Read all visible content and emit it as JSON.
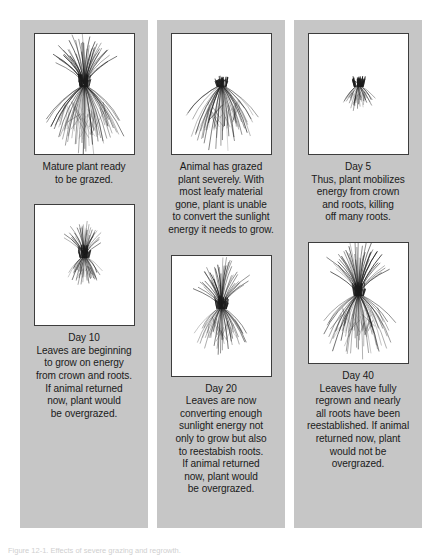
{
  "figure": {
    "background_color": "#ffffff",
    "panel_color": "#c6c6c6",
    "frame_border_color": "#3d3d3d",
    "text_color": "#1a1a1a",
    "note": "Figure 12-1. Effects of severe grazing and regrowth."
  },
  "panels": [
    {
      "id": "panel-1",
      "top": {
        "art_name": "mature-plant-illustration",
        "stage": "mature",
        "leaf_height": 46,
        "root_depth": 62,
        "leaf_density": 40,
        "root_density": 46,
        "caption": "Mature plant ready\nto be grazed."
      },
      "bottom": {
        "art_name": "day-10-plant-illustration",
        "stage": "day-10",
        "leaf_height": 30,
        "root_depth": 26,
        "leaf_density": 30,
        "root_density": 26,
        "caption": "Day 10\nLeaves are beginning\nto grow on energy\nfrom crown and roots.\nIf animal returned\nnow, plant would\nbe overgrazed."
      }
    },
    {
      "id": "panel-2",
      "top": {
        "art_name": "grazed-plant-illustration",
        "stage": "grazed",
        "leaf_height": 7,
        "root_depth": 58,
        "leaf_density": 16,
        "root_density": 44,
        "caption": "Animal has grazed\nplant severely. With\nmost leafy material\ngone, plant is unable\nto convert the sunlight\nenergy it needs to grow."
      },
      "bottom": {
        "art_name": "day-20-plant-illustration",
        "stage": "day-20",
        "leaf_height": 42,
        "root_depth": 42,
        "leaf_density": 38,
        "root_density": 36,
        "caption": "Day 20\nLeaves are now\nconverting enough\nsunlight energy not\nonly to grow but also\nto reestabish roots.\nIf animal returned\nnow, plant would\nbe overgrazed."
      }
    },
    {
      "id": "panel-3",
      "top": {
        "art_name": "day-5-plant-illustration",
        "stage": "day-5",
        "leaf_height": 6,
        "root_depth": 24,
        "leaf_density": 14,
        "root_density": 24,
        "caption": "Day 5\nThus, plant mobilizes\nenergy from crown\nand roots, killing\noff many roots."
      },
      "bottom": {
        "art_name": "day-40-plant-illustration",
        "stage": "day-40",
        "leaf_height": 48,
        "root_depth": 58,
        "leaf_density": 42,
        "root_density": 44,
        "caption": "Day 40\nLeaves have fully\nregrown and nearly\nall roots have been\nreestablished. If animal\nreturned now, plant\nwould not be\novergrazed."
      }
    }
  ]
}
